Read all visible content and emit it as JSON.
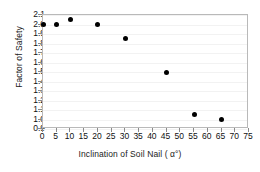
{
  "chart_data": {
    "type": "scatter",
    "title": "",
    "xlabel": "Inclination of Soil Nail ( α°)",
    "ylabel": "Factor of Safety",
    "xlim": [
      0,
      75
    ],
    "ylim": [
      0.9,
      2.1
    ],
    "xticks": [
      0,
      5,
      10,
      15,
      20,
      25,
      30,
      35,
      40,
      45,
      50,
      55,
      60,
      65,
      70,
      75
    ],
    "xtick_labels": [
      "0",
      "5",
      "10",
      "15",
      "20",
      "25",
      "30",
      "35",
      "40",
      "45",
      "50",
      "55",
      "60",
      "65",
      "70",
      "75"
    ],
    "yticks": [
      0.9,
      1.0,
      1.1,
      1.2,
      1.3,
      1.4,
      1.5,
      1.6,
      1.7,
      1.8,
      1.9,
      2.0,
      2.1
    ],
    "ytick_labels": [
      "0.9",
      "1.0",
      "1.1",
      "1.2",
      "1.3",
      "1.4",
      "1.5",
      "1.6",
      "1.7",
      "1.8",
      "1.9",
      "2.0",
      "2.1"
    ],
    "grid": true,
    "legend": null,
    "marker_color": "#000000",
    "marker": "circle",
    "x": [
      0,
      5,
      10,
      20,
      30,
      45,
      55,
      65
    ],
    "y": [
      2.0,
      2.0,
      2.05,
      2.0,
      1.85,
      1.5,
      1.05,
      1.0
    ],
    "points": [
      {
        "x": 0,
        "y": 2.0
      },
      {
        "x": 5,
        "y": 2.0
      },
      {
        "x": 10,
        "y": 2.05
      },
      {
        "x": 20,
        "y": 2.0
      },
      {
        "x": 30,
        "y": 1.85
      },
      {
        "x": 45,
        "y": 1.5
      },
      {
        "x": 55,
        "y": 1.05
      },
      {
        "x": 65,
        "y": 1.0
      }
    ]
  }
}
